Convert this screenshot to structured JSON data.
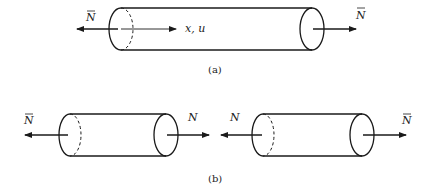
{
  "figure": {
    "panel_a": {
      "caption": "(a)",
      "axis_label": "x, u",
      "left_force": {
        "symbol": "N",
        "overbar": true,
        "direction": "left"
      },
      "right_force": {
        "symbol": "N",
        "overbar": true,
        "direction": "right"
      }
    },
    "panel_b": {
      "caption": "(b)",
      "left_segment": {
        "left_force": {
          "symbol": "N",
          "overbar": true,
          "direction": "left"
        },
        "right_force": {
          "symbol": "N",
          "overbar": false,
          "direction": "right"
        }
      },
      "right_segment": {
        "left_force": {
          "symbol": "N",
          "overbar": false,
          "direction": "left"
        },
        "right_force": {
          "symbol": "N",
          "overbar": true,
          "direction": "right"
        }
      }
    },
    "colors": {
      "ink": "#1a1a1a",
      "background": "#ffffff"
    }
  }
}
